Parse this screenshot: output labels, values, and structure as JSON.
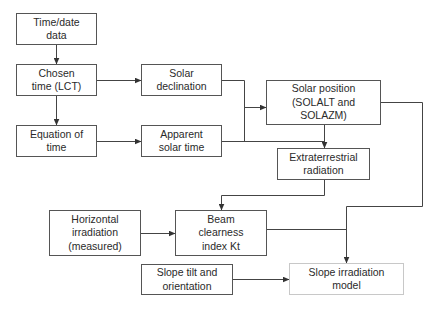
{
  "diagram": {
    "type": "flowchart",
    "nodes": [
      {
        "id": "time_date_data",
        "label": "Time/date\ndata"
      },
      {
        "id": "chosen_time",
        "label": "Chosen\ntime (LCT)"
      },
      {
        "id": "solar_declination",
        "label": "Solar\ndeclination"
      },
      {
        "id": "equation_of_time",
        "label": "Equation of\ntime"
      },
      {
        "id": "apparent_solar_time",
        "label": "Apparent\nsolar time"
      },
      {
        "id": "solar_position",
        "label": "Solar position\n(SOLALT and\nSOLAZM)"
      },
      {
        "id": "extraterrestrial_radiation",
        "label": "Extraterrestrial\nradiation"
      },
      {
        "id": "horizontal_irradiation",
        "label": "Horizontal\nirradiation\n(measured)"
      },
      {
        "id": "beam_clearness_index",
        "label": "Beam\nclearness\nindex Kt"
      },
      {
        "id": "slope_tilt",
        "label": "Slope tilt and\norientation"
      },
      {
        "id": "slope_irradiation_model",
        "label": "Slope irradiation\nmodel"
      }
    ],
    "edges": [
      {
        "from": "time_date_data",
        "to": "chosen_time"
      },
      {
        "from": "chosen_time",
        "to": "solar_declination"
      },
      {
        "from": "chosen_time",
        "to": "equation_of_time"
      },
      {
        "from": "equation_of_time",
        "to": "apparent_solar_time"
      },
      {
        "from": "solar_declination",
        "to": "solar_position"
      },
      {
        "from": "apparent_solar_time",
        "to": "solar_position"
      },
      {
        "from": "apparent_solar_time",
        "to": "extraterrestrial_radiation"
      },
      {
        "from": "solar_position",
        "to": "extraterrestrial_radiation"
      },
      {
        "from": "extraterrestrial_radiation",
        "to": "beam_clearness_index"
      },
      {
        "from": "horizontal_irradiation",
        "to": "beam_clearness_index"
      },
      {
        "from": "solar_position",
        "to": "slope_irradiation_model"
      },
      {
        "from": "beam_clearness_index",
        "to": "slope_irradiation_model"
      },
      {
        "from": "slope_tilt",
        "to": "slope_irradiation_model"
      }
    ]
  },
  "colors": {
    "line": "#444444",
    "box_border": "#555555",
    "box_border_light": "#c8c8c8",
    "text": "#2a2a2a"
  }
}
